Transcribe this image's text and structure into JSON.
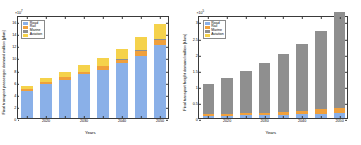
{
  "chart_data": [
    {
      "type": "bar",
      "id": "passenger",
      "title": "",
      "xlabel": "Years",
      "ylabel": "Final transport passenger demand million [pkm]",
      "y_exponent_text": "×10",
      "y_exponent_sup": "7",
      "categories": [
        "2015",
        "2020",
        "2025",
        "2030",
        "2035",
        "2040",
        "2045",
        "2050"
      ],
      "xtick_labels": [
        "2020",
        "2030",
        "2040",
        "2050"
      ],
      "xtick_positions": [
        1,
        3,
        5,
        7
      ],
      "ytick_labels": [
        "0",
        "2",
        "4",
        "6",
        "8",
        "10",
        "12",
        "14",
        "16"
      ],
      "ylim": [
        0,
        17
      ],
      "grid": false,
      "legend_position": "upper left",
      "series": [
        {
          "name": "Road",
          "color": "#8ab0e8",
          "values": [
            4.5,
            5.6,
            6.3,
            7.2,
            8.0,
            9.0,
            10.3,
            12.0
          ]
        },
        {
          "name": "Rail",
          "color": "#f0a03c",
          "values": [
            0.3,
            0.35,
            0.4,
            0.45,
            0.55,
            0.65,
            0.8,
            0.95
          ]
        },
        {
          "name": "Marine",
          "color": "#8f8f8f",
          "values": [
            0.02,
            0.02,
            0.03,
            0.03,
            0.04,
            0.04,
            0.05,
            0.05
          ]
        },
        {
          "name": "Aviation",
          "color": "#f5d24b",
          "values": [
            0.5,
            0.63,
            0.8,
            1.02,
            1.3,
            1.7,
            2.2,
            2.5
          ]
        }
      ]
    },
    {
      "type": "bar",
      "id": "freight",
      "title": "",
      "xlabel": "Years",
      "ylabel": "Final transport freight demand million [t-km]",
      "y_exponent_text": "×10",
      "y_exponent_sup": "5",
      "categories": [
        "2015",
        "2020",
        "2025",
        "2030",
        "2035",
        "2040",
        "2045",
        "2050"
      ],
      "xtick_labels": [
        "2020",
        "2030",
        "2040",
        "2050"
      ],
      "xtick_positions": [
        1,
        3,
        5,
        7
      ],
      "ytick_labels": [
        "0",
        "0.5",
        "1",
        "1.5",
        "2",
        "2.5",
        "3"
      ],
      "ylim": [
        0,
        3.2
      ],
      "grid": false,
      "legend_position": "upper left",
      "series": [
        {
          "name": "Road",
          "color": "#8ab0e8",
          "values": [
            0.06,
            0.07,
            0.08,
            0.09,
            0.1,
            0.115,
            0.13,
            0.15
          ]
        },
        {
          "name": "Rail",
          "color": "#f0a03c",
          "values": [
            0.055,
            0.062,
            0.07,
            0.08,
            0.092,
            0.11,
            0.14,
            0.175
          ]
        },
        {
          "name": "Marine",
          "color": "#8f8f8f",
          "values": [
            0.955,
            1.118,
            1.3,
            1.53,
            1.788,
            2.075,
            2.43,
            2.955
          ]
        },
        {
          "name": "Aviation",
          "color": "#f5d24b",
          "values": [
            0.002,
            0.002,
            0.003,
            0.003,
            0.004,
            0.004,
            0.005,
            0.006
          ]
        }
      ]
    }
  ],
  "legend": {
    "entries": [
      "Road",
      "Rail",
      "Marine",
      "Aviation"
    ]
  }
}
